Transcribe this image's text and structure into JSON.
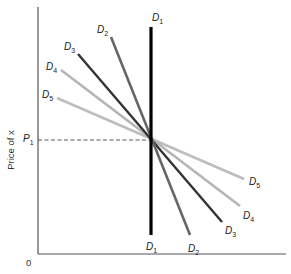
{
  "chart_data": {
    "type": "line",
    "title": "",
    "xlabel": "",
    "ylabel": "Price of x",
    "origin_label": "0",
    "reference_line": {
      "label": "P1",
      "label_main": "P",
      "label_sub": "1",
      "style": "dashed"
    },
    "series": [
      {
        "name": "D1",
        "main": "D",
        "sub": "1",
        "color": "#000000",
        "width": 3.2,
        "top": [
          151,
          27
        ],
        "bottom": [
          151,
          235
        ],
        "top_label": [
          152,
          21
        ],
        "bottom_label": [
          146,
          250
        ]
      },
      {
        "name": "D2",
        "main": "D",
        "sub": "2",
        "color": "#666666",
        "width": 2.6,
        "top": [
          111,
          37
        ],
        "bottom": [
          190,
          235
        ],
        "top_label": [
          97,
          33
        ],
        "bottom_label": [
          188,
          252
        ]
      },
      {
        "name": "D3",
        "main": "D",
        "sub": "3",
        "color": "#333333",
        "width": 2.4,
        "top": [
          78,
          54
        ],
        "bottom": [
          222,
          222
        ],
        "top_label": [
          64,
          50
        ],
        "bottom_label": [
          225,
          234
        ]
      },
      {
        "name": "D4",
        "main": "D",
        "sub": "4",
        "color": "#b5b5b5",
        "width": 2.6,
        "top": [
          61,
          70
        ],
        "bottom": [
          240,
          206
        ],
        "top_label": [
          46,
          70
        ],
        "bottom_label": [
          243,
          219
        ]
      },
      {
        "name": "D5",
        "main": "D",
        "sub": "5",
        "color": "#bdbdbd",
        "width": 2.6,
        "top": [
          57,
          98
        ],
        "bottom": [
          244,
          179
        ],
        "top_label": [
          42,
          98
        ],
        "bottom_label": [
          249,
          185
        ]
      }
    ],
    "axes": {
      "x_axis_y": 254,
      "y_axis_x": 38,
      "x_end": 286,
      "y_top": 7
    },
    "intersection": [
      151,
      140
    ]
  }
}
